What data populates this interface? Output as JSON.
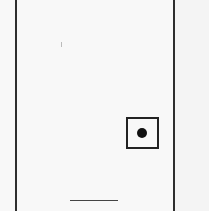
{
  "document": {
    "type": "scanned-form-fragment",
    "checkbox": {
      "state": "selected",
      "marker": "filled-dot"
    },
    "signature_line": {
      "label": ""
    },
    "colors": {
      "paper": "#f8f8f8",
      "ink": "#222222"
    }
  }
}
